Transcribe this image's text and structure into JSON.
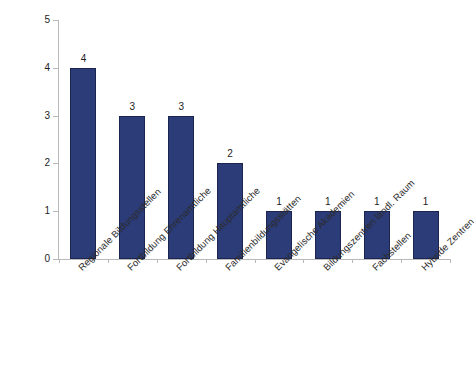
{
  "chart_data": {
    "type": "bar",
    "title": "",
    "subtitle": "",
    "xlabel": "",
    "ylabel": "",
    "ylim": [
      0,
      5
    ],
    "y_ticks": [
      "0",
      "1",
      "2",
      "3",
      "4",
      "5"
    ],
    "grid": false,
    "legend": null,
    "legend_position": "none",
    "bar_color": "#2b3c78",
    "bar_border_color": "#1b2550",
    "axis_color": "#b9b9b9",
    "text_color": "#1d1d1d",
    "background": "#ffffff",
    "label_rotation_deg": -45,
    "show_value_labels": true,
    "categories": [
      "Regionale Bildungsstellen",
      "Fortbildung Ehrenamtliche",
      "Fortbildung Hauptamtliche",
      "Familienbildungsstätten",
      "Evangelische Akademien",
      "Bildungszentren ländl. Raum",
      "Fachstellen",
      "Hybride Zentren"
    ],
    "values": [
      4,
      3,
      3,
      2,
      1,
      1,
      1,
      1
    ],
    "value_labels": [
      "4",
      "3",
      "3",
      "2",
      "1",
      "1",
      "1",
      "1"
    ]
  }
}
